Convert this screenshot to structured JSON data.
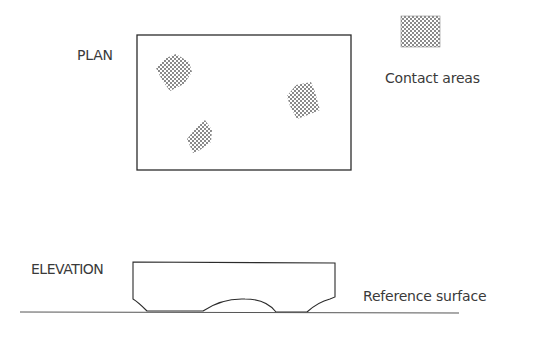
{
  "diagram": {
    "plan": {
      "label": "PLAN",
      "outline": {
        "x": 137,
        "y": 35,
        "width": 214,
        "height": 135
      },
      "contact_patches": [
        {
          "id": "top-left",
          "points": "156,68 166,58 176,54 189,62 192,72 184,84 170,91 162,80"
        },
        {
          "id": "bottom-middle",
          "points": "187,139 196,128 205,120 212,130 211,142 200,150 193,153"
        },
        {
          "id": "right",
          "points": "287,96 296,85 311,82 315,92 320,110 308,115 297,119 290,106"
        }
      ]
    },
    "legend": {
      "swatch": {
        "x": 401,
        "y": 16,
        "width": 39,
        "height": 31
      },
      "label": "Contact areas"
    },
    "elevation": {
      "label": "ELEVATION",
      "outline_path": "M133,262 L335,263 L335,297 L330,299 Q318,302 307,312 L276,312 Q266,299 245,299 Q222,298 203,311 L147,311 Q138,302 133,299 Z"
    },
    "reference": {
      "label": "Reference surface",
      "line": {
        "x1": 20,
        "y1": 312,
        "x2": 459,
        "y2": 313
      }
    },
    "colors": {
      "stroke": "#2b2b2b",
      "text": "#3a3a3a",
      "hatch": "#8a8a8a",
      "background": "#ffffff"
    }
  }
}
